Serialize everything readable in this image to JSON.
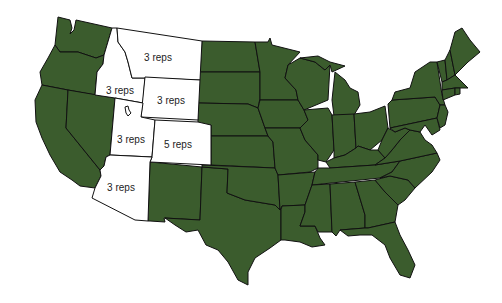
{
  "map": {
    "title": "",
    "colors": {
      "default_fill": "#3b5c2d",
      "highlight_fill": "#ffffff",
      "border": "#111111",
      "background": "#ffffff"
    },
    "highlighted_states": [
      {
        "state": "Montana",
        "label": "3 reps",
        "x": 158,
        "y": 57
      },
      {
        "state": "Idaho",
        "label": "3 reps",
        "x": 120,
        "y": 90
      },
      {
        "state": "Wyoming",
        "label": "3 reps",
        "x": 171,
        "y": 100
      },
      {
        "state": "Utah",
        "label": "3 reps",
        "x": 131,
        "y": 139
      },
      {
        "state": "Colorado",
        "label": "5 reps",
        "x": 178,
        "y": 144
      },
      {
        "state": "Arizona",
        "label": "3 reps",
        "x": 121,
        "y": 187
      }
    ]
  }
}
